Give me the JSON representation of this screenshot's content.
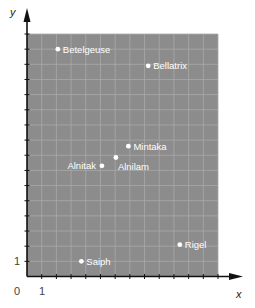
{
  "chart_data": {
    "type": "scatter",
    "title": "",
    "xlabel": "x",
    "ylabel": "y",
    "xlim": [
      0,
      13
    ],
    "ylim": [
      0,
      16
    ],
    "grid": true,
    "legend": null,
    "tick_labels": {
      "origin": "0",
      "x": [
        {
          "value": 1,
          "label": "1"
        }
      ],
      "y": [
        {
          "value": 1,
          "label": "1"
        }
      ]
    },
    "colors": {
      "plot_background": "#8c8c8c",
      "grid": "#a9a9a9",
      "points": "#ffffff",
      "axis": "#111111"
    },
    "points": [
      {
        "name": "Betelgeuse",
        "x": 2.1,
        "y": 15.0,
        "label_side": "right"
      },
      {
        "name": "Bellatrix",
        "x": 8.25,
        "y": 13.9,
        "label_side": "right"
      },
      {
        "name": "Mintaka",
        "x": 6.9,
        "y": 8.6,
        "label_side": "right"
      },
      {
        "name": "Alnilam",
        "x": 6.05,
        "y": 7.85,
        "label_side": "below-right"
      },
      {
        "name": "Alnitak",
        "x": 5.1,
        "y": 7.3,
        "label_side": "left"
      },
      {
        "name": "Saiph",
        "x": 3.7,
        "y": 1.0,
        "label_side": "right"
      },
      {
        "name": "Rigel",
        "x": 10.4,
        "y": 2.1,
        "label_side": "right"
      }
    ]
  }
}
